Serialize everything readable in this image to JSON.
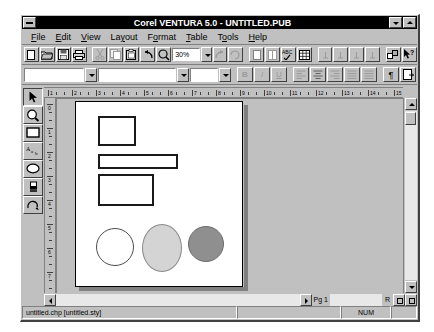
{
  "window": {
    "title": "Corel VENTURA 5.0 - UNTITLED.PUB",
    "sysmenu_name": "system-menu-icon",
    "minimize_label": "",
    "maximize_label": ""
  },
  "menubar": {
    "items": [
      {
        "label": "File",
        "accel": "F"
      },
      {
        "label": "Edit",
        "accel": "E"
      },
      {
        "label": "View",
        "accel": "V"
      },
      {
        "label": "Layout",
        "accel": "L"
      },
      {
        "label": "Format",
        "accel": "o"
      },
      {
        "label": "Table",
        "accel": "T"
      },
      {
        "label": "Tools",
        "accel": "o"
      },
      {
        "label": "Help",
        "accel": "H"
      }
    ]
  },
  "toolbar_main": {
    "zoom_value": "30%",
    "buttons": [
      {
        "name": "new-file-button",
        "glyph": "page",
        "enabled": true
      },
      {
        "name": "open-file-button",
        "glyph": "folder",
        "enabled": true
      },
      {
        "name": "save-file-button",
        "glyph": "disk",
        "enabled": true
      },
      {
        "name": "print-button",
        "glyph": "printer",
        "enabled": true
      },
      {
        "name": "cut-button",
        "glyph": "scissors",
        "enabled": false
      },
      {
        "name": "copy-button",
        "glyph": "copy",
        "enabled": false
      },
      {
        "name": "paste-button",
        "glyph": "clipboard",
        "enabled": true
      },
      {
        "name": "undo-button",
        "glyph": "undo-arrow",
        "enabled": true
      },
      {
        "name": "zoom-tool-button",
        "glyph": "magnifier",
        "enabled": true
      }
    ],
    "buttons_right": [
      {
        "name": "redo-button",
        "glyph": "redo-arrow",
        "enabled": false
      },
      {
        "name": "refresh-button",
        "glyph": "refresh",
        "enabled": false
      },
      {
        "name": "frame-button",
        "glyph": "frame",
        "enabled": false
      },
      {
        "name": "column-button",
        "glyph": "column",
        "enabled": false
      },
      {
        "name": "spellcheck-button",
        "glyph": "abc-check",
        "enabled": true
      },
      {
        "name": "table-button",
        "glyph": "grid",
        "enabled": true
      },
      {
        "name": "tab-left-button",
        "glyph": "tab-mark",
        "enabled": false
      },
      {
        "name": "tab-center-button",
        "glyph": "tab-mark",
        "enabled": false
      },
      {
        "name": "tab-right-button",
        "glyph": "tab-mark",
        "enabled": false
      },
      {
        "name": "tab-decimal-button",
        "glyph": "tab-mark",
        "enabled": false
      },
      {
        "name": "node-edit-button",
        "glyph": "node",
        "enabled": true
      },
      {
        "name": "context-help-button",
        "glyph": "arrow-question",
        "enabled": true
      }
    ]
  },
  "toolbar_format": {
    "style_value": "",
    "style_placeholder": "",
    "font_value": "",
    "font_placeholder": "",
    "size_value": "",
    "size_placeholder": "",
    "buttons": [
      {
        "name": "bold-button",
        "label": "B",
        "enabled": false
      },
      {
        "name": "italic-button",
        "label": "I",
        "enabled": false
      },
      {
        "name": "underline-button",
        "label": "U",
        "enabled": false
      },
      {
        "name": "align-left-button",
        "label": "",
        "enabled": false
      },
      {
        "name": "align-center-button",
        "label": "",
        "enabled": true
      },
      {
        "name": "align-right-button",
        "label": "",
        "enabled": false
      },
      {
        "name": "align-justify-button",
        "label": "",
        "enabled": false
      },
      {
        "name": "align-force-button",
        "label": "",
        "enabled": false
      },
      {
        "name": "show-paragraph-marks-button",
        "label": "¶",
        "enabled": true
      },
      {
        "name": "page-layout-button",
        "label": "",
        "enabled": true
      }
    ]
  },
  "toolbox": {
    "items": [
      {
        "name": "pick-tool",
        "glyph": "arrow-pointer",
        "selected": true
      },
      {
        "name": "zoom-tool",
        "glyph": "magnifier"
      },
      {
        "name": "rectangle-tool",
        "glyph": "rectangle"
      },
      {
        "name": "text-tool",
        "glyph": "text-abc"
      },
      {
        "name": "ellipse-tool",
        "glyph": "ellipse"
      },
      {
        "name": "fill-tool",
        "glyph": "paint-bucket"
      },
      {
        "name": "outline-tool",
        "glyph": "outline-pen"
      }
    ]
  },
  "rulers": {
    "horizontal_labels": [
      "1",
      "2",
      "3",
      "4",
      "5",
      "6",
      "7",
      "8",
      "9",
      "10",
      "11",
      "12",
      "13",
      "14",
      "15",
      "16",
      "17",
      "18",
      "19",
      "20"
    ],
    "vertical_labels": [
      "0",
      "1",
      "2",
      "3",
      "4",
      "5",
      "6",
      "7",
      "8",
      "9",
      "10",
      "11"
    ],
    "units": "picas"
  },
  "document": {
    "shapes": [
      {
        "name": "rectangle-shape-1",
        "type": "rect",
        "left": 22,
        "top": 14,
        "width": 38,
        "height": 30,
        "fill": "#ffffff",
        "stroke": "#1a1a1a"
      },
      {
        "name": "rectangle-shape-2",
        "type": "rect",
        "left": 22,
        "top": 52,
        "width": 80,
        "height": 15,
        "fill": "#ffffff",
        "stroke": "#1a1a1a"
      },
      {
        "name": "rectangle-shape-3",
        "type": "rect",
        "left": 22,
        "top": 72,
        "width": 56,
        "height": 32,
        "fill": "#ffffff",
        "stroke": "#1a1a1a"
      },
      {
        "name": "ellipse-shape-1",
        "type": "ellipse",
        "left": 20,
        "top": 126,
        "width": 38,
        "height": 38,
        "fill": "#ffffff",
        "stroke": "#4d4d4d"
      },
      {
        "name": "ellipse-shape-2",
        "type": "ellipse",
        "left": 66,
        "top": 122,
        "width": 40,
        "height": 48,
        "fill": "#d4d4d4",
        "stroke": "#8a8a8a"
      },
      {
        "name": "ellipse-shape-3",
        "type": "ellipse",
        "left": 112,
        "top": 124,
        "width": 36,
        "height": 36,
        "fill": "#8f8f8f",
        "stroke": "#6b6b6b"
      }
    ]
  },
  "scrollbars": {
    "page_indicator": "Pg 1",
    "right_indicator": "R"
  },
  "statusbar": {
    "file_info": "untitled.chp [untitled.sty]",
    "middle": "",
    "num_indicator": "NUM",
    "end": ""
  },
  "colors": {
    "face": "#c0c0c0",
    "shadow": "#808080",
    "dark": "#404040",
    "light": "#ffffff",
    "titlebar": "#000000",
    "canvas": "#c0c0c0",
    "page": "#ffffff"
  }
}
